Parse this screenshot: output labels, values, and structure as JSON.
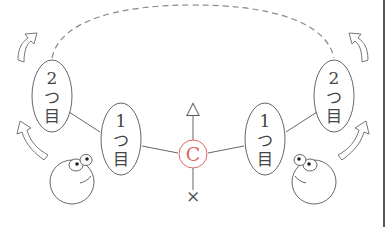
{
  "diagram": {
    "type": "move-tree",
    "center": {
      "label": "C",
      "color": "#e06666"
    },
    "top_symbol": "△",
    "bottom_symbol": "×",
    "left": {
      "first": {
        "number": "1",
        "kana": "つ",
        "kanji": "目"
      },
      "second": {
        "number": "2",
        "kana": "つ",
        "kanji": "目"
      }
    },
    "right": {
      "first": {
        "number": "1",
        "kana": "つ",
        "kanji": "目"
      },
      "second": {
        "number": "2",
        "kana": "つ",
        "kanji": "目"
      }
    },
    "connection": "dashed-arc-between-second-nodes",
    "colors": {
      "line": "#666666",
      "accent": "#e06666",
      "background": "#ffffff"
    }
  }
}
